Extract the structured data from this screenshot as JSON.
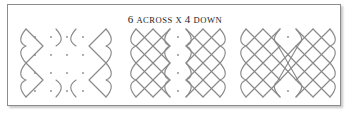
{
  "figure": {
    "caption": {
      "number_across": "6",
      "across_label": "ACROSS",
      "times_label": "X",
      "number_down": "4",
      "down_label": "DOWN",
      "full_text": "6 ACROSS X 4 DOWN"
    },
    "colors": {
      "stroke": "#8a8a8a",
      "border": "#8c8c8c",
      "background": "#ffffff",
      "text": "#1c1c1c"
    },
    "grid": {
      "columns": 6,
      "rows": 4,
      "dot_spacing_px": 11,
      "dot_radius_px": 0.85
    },
    "panels": [
      {
        "id": "panel-1",
        "name": "dot-grid-with-outer-arcs",
        "stage": "1",
        "description": "6 by 4 dot grid with outer boundary arcs and left and right zigzag loops drawn; interior dots still bare",
        "x": 10,
        "width": 100,
        "dots_visible": true,
        "weave_coverage": "edges-only"
      },
      {
        "id": "panel-2",
        "name": "partial-weave",
        "stage": "2",
        "description": "Left block woven into a full diagonal lattice, right block woven, central column of dots still open",
        "x": 118,
        "width": 104,
        "dots_visible": true,
        "weave_coverage": "partial"
      },
      {
        "id": "panel-3",
        "name": "complete-interlaced-kolam",
        "stage": "3",
        "description": "Both blocks fully woven and joined by crossing diagonals through the centre, forming the finished single-loop sikku kolam",
        "x": 228,
        "width": 104,
        "dots_visible": true,
        "weave_coverage": "full"
      }
    ]
  }
}
